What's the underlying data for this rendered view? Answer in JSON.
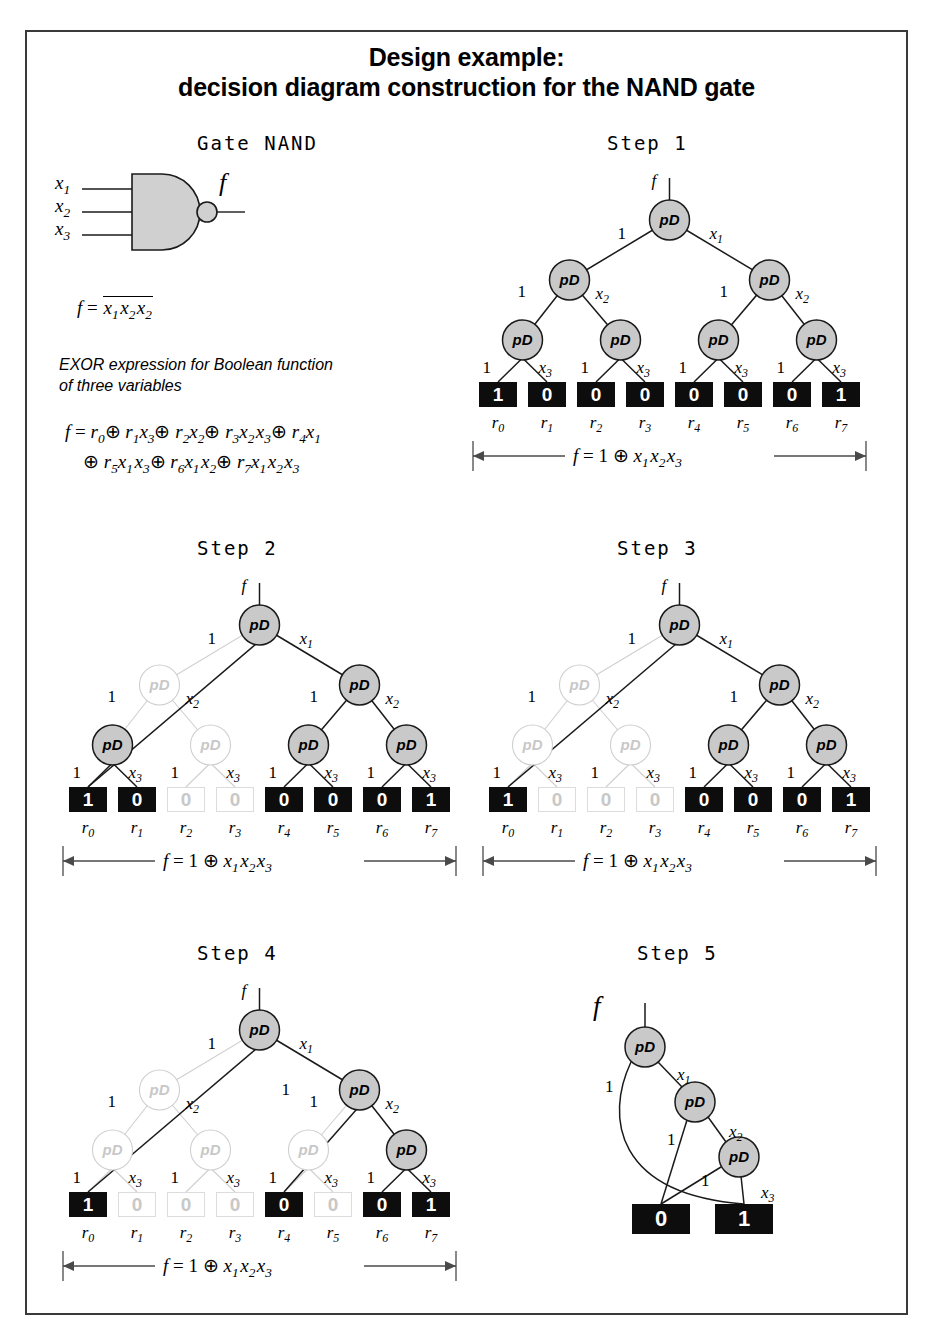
{
  "title": {
    "line1": "Design example:",
    "line2": "decision diagram construction for the NAND gate"
  },
  "gate": {
    "caption": "Gate NAND",
    "inputs": [
      "x1",
      "x2",
      "x3"
    ],
    "output": "f",
    "formula_lhs": "f =",
    "formula_overline": "x1 x2 x2"
  },
  "description": {
    "line1": "EXOR expression for Boolean function",
    "line2": "of three variables"
  },
  "expansion": {
    "line1": "f = r0⊕ r1x3⊕ r2x2⊕ r3x2 x3⊕ r4x1",
    "line2": "⊕ r5x1 x3⊕ r6x1 x2⊕ r7x1 x2 x3"
  },
  "node_label": "pD",
  "root_input_label": "f",
  "edge_labels": {
    "left": "1",
    "level1_right": "x1",
    "level2_right": "x2",
    "level3_right": "x3"
  },
  "terminal_index_labels": [
    "r0",
    "r1",
    "r2",
    "r3",
    "r4",
    "r5",
    "r6",
    "r7"
  ],
  "result_caption": "f = 1 ⊕  x1 x2 x3",
  "colors": {
    "node_fill": "#c9c9c9",
    "node_stroke": "#1a1a1a",
    "ghost_fill": "#ffffff",
    "ghost_stroke": "#cfcfcf",
    "ghost_text": "#c8c8c8",
    "terminal_active_bg": "#0d0d0d",
    "terminal_active_text": "#ffffff",
    "terminal_ghost_bg": "#ffffff",
    "terminal_ghost_text": "#c8c8c8",
    "border": "#3a3a3a"
  },
  "steps": [
    {
      "label": "Step 1",
      "terminals": [
        {
          "value": "1",
          "ghost": false
        },
        {
          "value": "0",
          "ghost": false
        },
        {
          "value": "0",
          "ghost": false
        },
        {
          "value": "0",
          "ghost": false
        },
        {
          "value": "0",
          "ghost": false
        },
        {
          "value": "0",
          "ghost": false
        },
        {
          "value": "0",
          "ghost": false
        },
        {
          "value": "1",
          "ghost": false
        }
      ],
      "ghost_nodes": [],
      "extra_edge_label": null
    },
    {
      "label": "Step 2",
      "terminals": [
        {
          "value": "1",
          "ghost": false
        },
        {
          "value": "0",
          "ghost": false
        },
        {
          "value": "0",
          "ghost": true
        },
        {
          "value": "0",
          "ghost": true
        },
        {
          "value": "0",
          "ghost": false
        },
        {
          "value": "0",
          "ghost": false
        },
        {
          "value": "0",
          "ghost": false
        },
        {
          "value": "1",
          "ghost": false
        }
      ],
      "ghost_nodes": [
        "L1",
        "L2b"
      ],
      "extra_edge_label": null
    },
    {
      "label": "Step 3",
      "terminals": [
        {
          "value": "1",
          "ghost": false
        },
        {
          "value": "0",
          "ghost": true
        },
        {
          "value": "0",
          "ghost": true
        },
        {
          "value": "0",
          "ghost": true
        },
        {
          "value": "0",
          "ghost": false
        },
        {
          "value": "0",
          "ghost": false
        },
        {
          "value": "0",
          "ghost": false
        },
        {
          "value": "1",
          "ghost": false
        }
      ],
      "ghost_nodes": [
        "L1",
        "L2a",
        "L2b"
      ],
      "extra_edge_label": null
    },
    {
      "label": "Step 4",
      "terminals": [
        {
          "value": "1",
          "ghost": false
        },
        {
          "value": "0",
          "ghost": true
        },
        {
          "value": "0",
          "ghost": true
        },
        {
          "value": "0",
          "ghost": true
        },
        {
          "value": "0",
          "ghost": false
        },
        {
          "value": "0",
          "ghost": true
        },
        {
          "value": "0",
          "ghost": false
        },
        {
          "value": "1",
          "ghost": false
        }
      ],
      "ghost_nodes": [
        "L1",
        "L2a",
        "L2b",
        "L2c"
      ],
      "extra_edge_label": "1"
    },
    {
      "label": "Step 5",
      "root_label": "f",
      "terminals": [
        {
          "value": "0",
          "ghost": false
        },
        {
          "value": "1",
          "ghost": false
        }
      ],
      "edge_labels": [
        "1",
        "x1",
        "1",
        "x2",
        "1",
        "x3"
      ]
    }
  ],
  "chart_data": {
    "type": "diagram",
    "title": "decision diagram construction for the NAND gate",
    "function": "f = NOT(x1 AND x2 AND x3)",
    "exor_coefficients": {
      "r0": 1,
      "r1": 0,
      "r2": 0,
      "r3": 0,
      "r4": 0,
      "r5": 0,
      "r6": 0,
      "r7": 1
    },
    "reduced_expression": "f = 1 ⊕ x1 x2 x3",
    "tree_levels": 3,
    "node_type": "pD (positive Davio)",
    "terminal_count": 8
  }
}
